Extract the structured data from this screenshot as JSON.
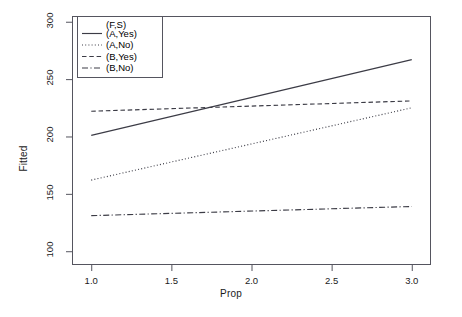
{
  "chart_data": {
    "type": "line",
    "title": "",
    "xlabel": "Prop",
    "ylabel": "Fitted",
    "xlim": [
      0.88,
      3.12
    ],
    "ylim": [
      88,
      305
    ],
    "xticks": [
      "1.0",
      "1.5",
      "2.0",
      "2.5",
      "3.0"
    ],
    "xtick_values": [
      1.0,
      1.5,
      2.0,
      2.5,
      3.0
    ],
    "yticks": [
      "100",
      "150",
      "200",
      "250",
      "300"
    ],
    "ytick_values": [
      100,
      150,
      200,
      250,
      300
    ],
    "grid": false,
    "legend_position": "top-left",
    "legend_title": "(F,S)",
    "x": [
      1.0,
      3.0
    ],
    "series": [
      {
        "name": "(A,Yes)",
        "style": "solid",
        "values": [
          201,
          267
        ]
      },
      {
        "name": "(A,No)",
        "style": "dotted",
        "values": [
          162,
          225
        ]
      },
      {
        "name": "(B,Yes)",
        "style": "dashed",
        "values": [
          222,
          231
        ]
      },
      {
        "name": "(B,No)",
        "style": "dashdot",
        "values": [
          131,
          139
        ]
      }
    ],
    "line_color": "#3c3c46"
  },
  "legend": {
    "title": "(F,S)",
    "entries": [
      {
        "label": "(A,Yes)"
      },
      {
        "label": "(A,No)"
      },
      {
        "label": "(B,Yes)"
      },
      {
        "label": "(B,No)"
      }
    ]
  },
  "axes": {
    "x": {
      "label": "Prop",
      "ticks": [
        "1.0",
        "1.5",
        "2.0",
        "2.5",
        "3.0"
      ]
    },
    "y": {
      "label": "Fitted",
      "ticks": [
        "100",
        "150",
        "200",
        "250",
        "300"
      ]
    }
  }
}
